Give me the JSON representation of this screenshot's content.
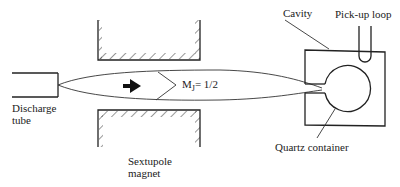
{
  "diagram": {
    "labels": {
      "discharge_tube_line1": "Discharge",
      "discharge_tube_line2": "tube",
      "sextupole_line1": "Sextupole",
      "sextupole_line2": "magnet",
      "state_symbol": "M",
      "state_subscript": "J",
      "state_value": "= 1/2",
      "cavity": "Cavity",
      "pickup_loop": "Pick-up  loop",
      "quartz_container": "Quartz  container"
    },
    "components": [
      "discharge-tube",
      "sextupole-magnet",
      "atomic-beam",
      "beam-direction-arrow",
      "cavity",
      "pick-up-loop",
      "quartz-container"
    ],
    "colors": {
      "line": "#222222",
      "background": "#ffffff"
    }
  }
}
